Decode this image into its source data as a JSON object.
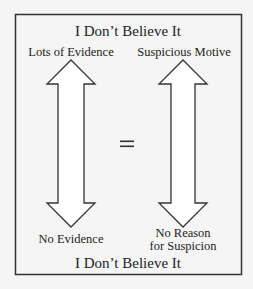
{
  "diagram": {
    "top_title": "I Don’t Believe It",
    "bottom_title": "I Don’t Believe It",
    "left_scale": {
      "top_label": "Lots of Evidence",
      "bottom_label": "No Evidence"
    },
    "right_scale": {
      "top_label": "Suspicious Motive",
      "bottom_label_line1": "No Reason",
      "bottom_label_line2": "for Suspicion"
    },
    "relation_symbol": "=",
    "colors": {
      "background": "#f5f5f5",
      "stroke": "#333333",
      "text": "#222222"
    }
  }
}
